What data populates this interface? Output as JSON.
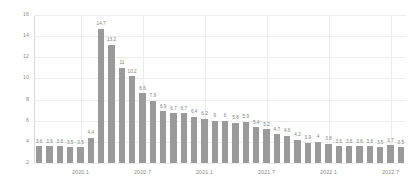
{
  "chart_data": {
    "type": "bar",
    "title": "",
    "subtitle": "",
    "xlabel": "",
    "ylabel": "",
    "ylim": [
      2,
      16
    ],
    "y_ticks": [
      "2",
      "4",
      "6",
      "8",
      "10",
      "12",
      "14",
      "16"
    ],
    "grid": true,
    "legend": null,
    "bar_color": "#9a9a9a",
    "gridline_color": "#ececec",
    "axis_color": "#d9d9d9",
    "label_color": "#8a8a8a",
    "value_label_color": "#7d7d7d",
    "x_tick_labels": [
      "2020.1",
      "2020.7",
      "2021.1",
      "2021.7",
      "2022.1",
      "2022.7"
    ],
    "x_tick_indices": [
      4,
      10,
      16,
      22,
      28,
      34
    ],
    "categories": [
      "2019.9",
      "2019.10",
      "2019.11",
      "2019.12",
      "2020.1",
      "2020.2",
      "2020.3",
      "2020.4",
      "2020.5",
      "2020.6",
      "2020.7",
      "2020.8",
      "2020.9",
      "2020.10",
      "2020.11",
      "2020.12",
      "2021.1",
      "2021.2",
      "2021.3",
      "2021.4",
      "2021.5",
      "2021.6",
      "2021.7",
      "2021.8",
      "2021.9",
      "2021.10",
      "2021.11",
      "2021.12",
      "2022.1",
      "2022.2",
      "2022.3",
      "2022.4",
      "2022.5",
      "2022.6",
      "2022.7",
      "2022.8"
    ],
    "values": [
      3.6,
      3.6,
      3.6,
      3.5,
      3.5,
      4.4,
      14.7,
      13.2,
      11,
      10.2,
      8.6,
      7.9,
      6.9,
      6.7,
      6.7,
      6.4,
      6.2,
      6,
      6,
      5.8,
      5.9,
      5.4,
      5.2,
      4.7,
      4.6,
      4.2,
      3.9,
      4,
      3.8,
      3.6,
      3.6,
      3.6,
      3.6,
      3.5,
      3.7,
      3.5
    ],
    "value_labels": [
      "3.6",
      "3.6",
      "3.6",
      "3.5",
      "3.5",
      "4.4",
      "14.7",
      "13.2",
      "11",
      "10.2",
      "8.6",
      "7.9",
      "6.9",
      "6.7",
      "6.7",
      "6.4",
      "6.2",
      "6",
      "6",
      "5.8",
      "5.9",
      "5.4",
      "5.2",
      "4.7",
      "4.6",
      "4.2",
      "3.9",
      "4",
      "3.8",
      "3.6",
      "3.6",
      "3.6",
      "3.6",
      "3.5",
      "3.7",
      "3.5"
    ]
  }
}
